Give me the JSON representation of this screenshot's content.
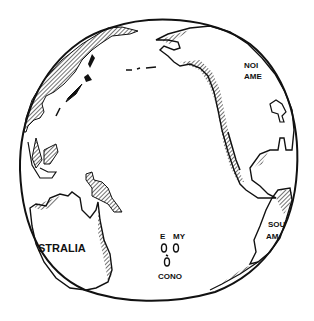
{
  "illustration": {
    "subject": "Hand-drawn globe centered on the Pacific Ocean",
    "labels": {
      "north_america": [
        "NOI",
        "AME"
      ],
      "south_america": [
        "SOU",
        "AM"
      ],
      "australia": "STRALIA",
      "islands_top_left": "E",
      "islands_top_right": "MY",
      "islands_bottom": "CONO"
    },
    "colors": {
      "ink": "#111111",
      "background": "#ffffff"
    }
  }
}
